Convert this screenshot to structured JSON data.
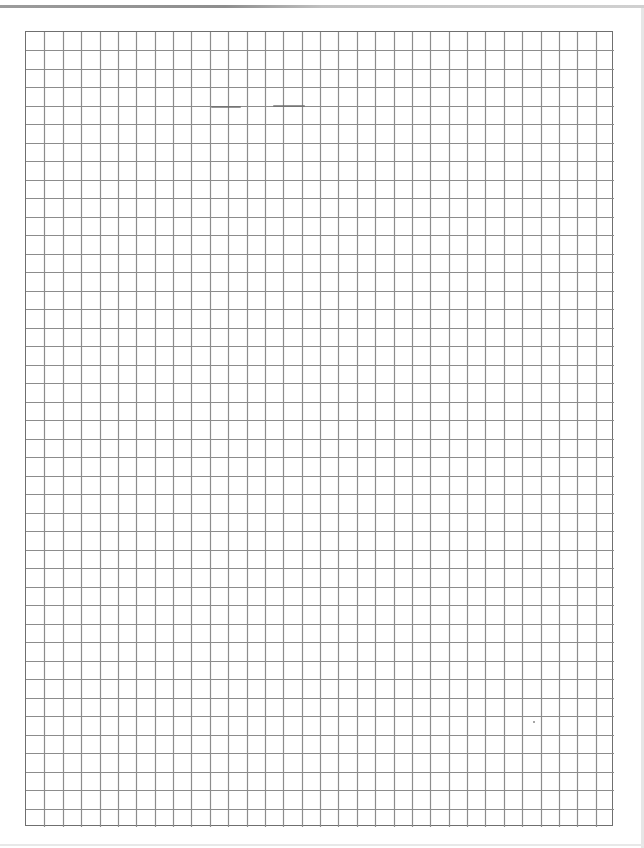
{
  "document": {
    "type": "graph-paper",
    "grid": {
      "left": 25,
      "top": 31,
      "width": 588,
      "height": 795,
      "columns": 32,
      "rows": 43,
      "line_color": "#8c8c8c",
      "border_color": "#6f6f6f"
    }
  }
}
